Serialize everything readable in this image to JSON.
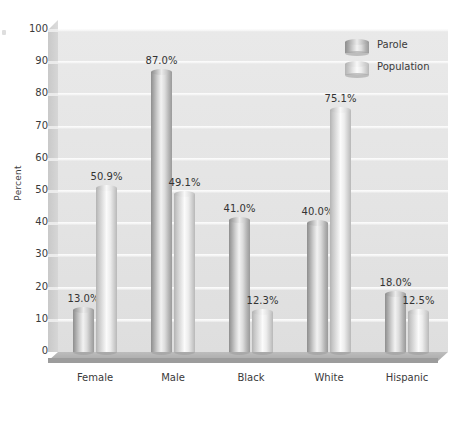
{
  "chart_data": {
    "type": "bar",
    "title": "",
    "subtitle": "",
    "xlabel": "",
    "ylabel": "Percent",
    "ylim": [
      0,
      100
    ],
    "ytick_step": 10,
    "yticks": [
      100,
      90,
      80,
      70,
      60,
      50,
      40,
      30,
      20,
      10,
      0
    ],
    "ytick_labels": [
      "100",
      "90",
      "80",
      "70",
      "60",
      "50",
      "40",
      "30",
      "20",
      "10",
      "0"
    ],
    "categories": [
      "Female",
      "Male",
      "Black",
      "White",
      "Hispanic"
    ],
    "series": [
      {
        "name": "Parole",
        "values": [
          13.0,
          87.0,
          41.0,
          40.0,
          18.0
        ],
        "labels": [
          "13.0%",
          "87.0%",
          "41.0%",
          "40.0%",
          "18.0%"
        ],
        "color": "#b9b9b9"
      },
      {
        "name": "Population",
        "values": [
          50.9,
          49.1,
          12.3,
          75.1,
          12.5
        ],
        "labels": [
          "50.9%",
          "49.1%",
          "12.3%",
          "75.1%",
          "12.5%"
        ],
        "color": "#dedede"
      }
    ],
    "grid": true,
    "grid_axis": "y",
    "legend_position": "top-right",
    "style": "3d-cylinder",
    "plot_background": "#e6e6e6",
    "gridline_color": "#f8f8f8",
    "text_color": "#3a3a3a"
  },
  "legend": {
    "entries": [
      {
        "label": "Parole",
        "swatch": "cylinder-dark-icon"
      },
      {
        "label": "Population",
        "swatch": "cylinder-light-icon"
      }
    ]
  }
}
